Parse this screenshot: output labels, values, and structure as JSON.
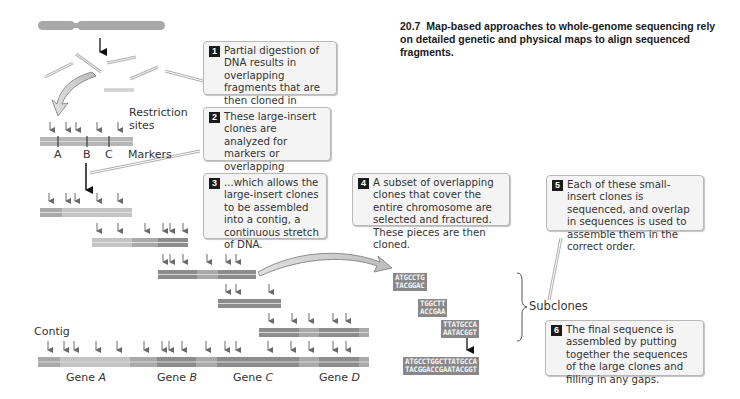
{
  "caption": {
    "number": "20.7",
    "text": "Map-based approaches to whole-genome sequencing rely on detailed genetic and physical maps to align sequenced fragments."
  },
  "steps": [
    {
      "n": "1",
      "text": "Partial digestion of DNA results in overlapping fragments that are then cloned in bacteria."
    },
    {
      "n": "2",
      "text": "These large-insert clones are analyzed for markers or overlapping restriction sites,..."
    },
    {
      "n": "3",
      "text": "...which allows the large-insert clones to be assembled into a contig, a continuous stretch of DNA."
    },
    {
      "n": "4",
      "text": "A subset of overlapping clones that cover the entire chromosome are selected and fractured. These pieces are then cloned."
    },
    {
      "n": "5",
      "text": "Each of these small-insert clones is sequenced, and overlap in sequences is used to assemble them in the correct order."
    },
    {
      "n": "6",
      "text": "The final sequence is assembled by putting together the sequences of the large clones and filling in any gaps."
    }
  ],
  "labels": {
    "restriction_sites": "Restriction sites",
    "markers": "Markers",
    "marker_a": "A",
    "marker_b": "B",
    "marker_c": "C",
    "contig": "Contig",
    "subclones": "Subclones"
  },
  "genes": [
    {
      "prefix": "Gene ",
      "name": "A"
    },
    {
      "prefix": "Gene ",
      "name": "B"
    },
    {
      "prefix": "Gene ",
      "name": "C"
    },
    {
      "prefix": "Gene ",
      "name": "D"
    }
  ],
  "subclone_sequences": [
    {
      "top": "ATGCCTG",
      "bottom": "TACGGAC"
    },
    {
      "top": "TGGCTT",
      "bottom": "ACCGAA"
    },
    {
      "top": "TTATGCCA",
      "bottom": "AATACGGT"
    }
  ],
  "final_sequence": {
    "top": "ATGCCTGGCTTATGCCA",
    "bottom": "TACGGACCGAATACGGT"
  },
  "colors": {
    "chromosome": "#a8a8a8",
    "light_band": "#c4c4c4",
    "mid_band": "#a9a9a9",
    "dark_band": "#8c8c8c",
    "arrow": "#6a6a6a",
    "callout_bg": "#f4f4f4",
    "badge": "#1a1a1a"
  }
}
